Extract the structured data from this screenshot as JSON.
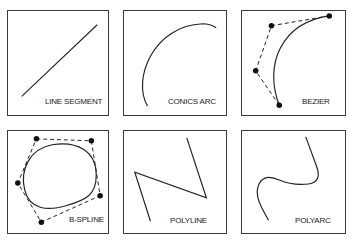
{
  "colors": {
    "stroke": "#222222",
    "border": "#3a3a3a",
    "background": "#ffffff"
  },
  "panels": [
    {
      "id": "line-segment",
      "label": "LINE SEGMENT"
    },
    {
      "id": "conics-arc",
      "label": "CONICS ARC"
    },
    {
      "id": "bezier",
      "label": "BEZIER"
    },
    {
      "id": "b-spline",
      "label": "B-SPLINE"
    },
    {
      "id": "polyline",
      "label": "POLYLINE"
    },
    {
      "id": "polyarc",
      "label": "POLYARC"
    }
  ]
}
